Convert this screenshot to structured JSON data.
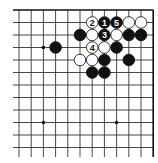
{
  "diagram": {
    "type": "go-board-fragment",
    "corner": "top-right",
    "grid": {
      "origin_x": 19,
      "origin_y": 10,
      "spacing_x": 12.2,
      "spacing_y": 12.5,
      "cols": 12,
      "rows": 12,
      "line_extend_left_to": 13,
      "line_extend_down_to": 157,
      "line_color": "#333333",
      "border_color": "#111111"
    },
    "hoshi": [
      {
        "col": 2,
        "row": 3
      },
      {
        "col": 2,
        "row": 9
      },
      {
        "col": 8,
        "row": 9
      }
    ],
    "stones": [
      {
        "col": 6,
        "row": 1,
        "color": "white",
        "label": "2"
      },
      {
        "col": 7,
        "row": 1,
        "color": "black",
        "label": "1"
      },
      {
        "col": 8,
        "row": 1,
        "color": "black",
        "label": "5"
      },
      {
        "col": 9,
        "row": 1,
        "color": "white",
        "label": ""
      },
      {
        "col": 10,
        "row": 1,
        "color": "white",
        "label": ""
      },
      {
        "col": 5,
        "row": 2,
        "color": "black",
        "label": ""
      },
      {
        "col": 6,
        "row": 2,
        "color": "white",
        "label": ""
      },
      {
        "col": 7,
        "row": 2,
        "color": "black",
        "label": "3"
      },
      {
        "col": 8,
        "row": 2,
        "color": "white",
        "label": ""
      },
      {
        "col": 9,
        "row": 2,
        "color": "black",
        "label": ""
      },
      {
        "col": 10,
        "row": 2,
        "color": "black",
        "label": ""
      },
      {
        "col": 3,
        "row": 3,
        "color": "black",
        "label": ""
      },
      {
        "col": 6,
        "row": 3,
        "color": "white",
        "label": "4"
      },
      {
        "col": 7,
        "row": 3,
        "color": "white",
        "label": ""
      },
      {
        "col": 8,
        "row": 3,
        "color": "black",
        "label": ""
      },
      {
        "col": 5,
        "row": 4,
        "color": "white",
        "label": ""
      },
      {
        "col": 6,
        "row": 4,
        "color": "white",
        "label": ""
      },
      {
        "col": 7,
        "row": 4,
        "color": "black",
        "label": ""
      },
      {
        "col": 9,
        "row": 4,
        "color": "black",
        "label": ""
      },
      {
        "col": 6,
        "row": 5,
        "color": "black",
        "label": ""
      },
      {
        "col": 7,
        "row": 5,
        "color": "black",
        "label": ""
      }
    ],
    "colors": {
      "black_stone": "#111111",
      "white_stone": "#ffffff",
      "white_stone_outline": "#222222",
      "hoshi": "#111111"
    }
  }
}
